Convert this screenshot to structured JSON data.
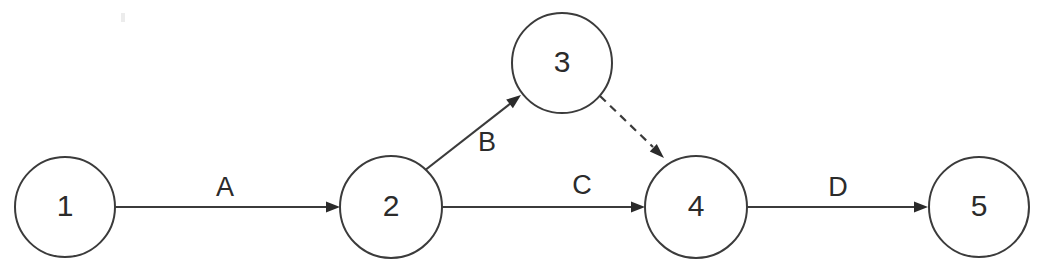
{
  "diagram": {
    "background_color": "#ffffff",
    "stroke_color": "#3b3b3b",
    "text_color": "#2b2b2b",
    "nodes": [
      {
        "id": "1",
        "label": "1",
        "cx": 65,
        "cy": 207,
        "r": 50
      },
      {
        "id": "2",
        "label": "2",
        "cx": 391,
        "cy": 207,
        "r": 51
      },
      {
        "id": "3",
        "label": "3",
        "cx": 562,
        "cy": 63,
        "r": 50
      },
      {
        "id": "4",
        "label": "4",
        "cx": 696,
        "cy": 207,
        "r": 51
      },
      {
        "id": "5",
        "label": "5",
        "cx": 979,
        "cy": 207,
        "r": 50
      }
    ],
    "edges": [
      {
        "id": "edge-a",
        "label": "A",
        "from": "1",
        "to": "2",
        "style": "solid",
        "arrow": true,
        "x1": 115,
        "y1": 207,
        "x2": 340,
        "y2": 207,
        "label_x": 225,
        "label_y": 189
      },
      {
        "id": "edge-b",
        "label": "B",
        "from": "2",
        "to": "3",
        "style": "solid",
        "arrow": true,
        "x1": 424,
        "y1": 171,
        "x2": 521,
        "y2": 95,
        "label_x": 487,
        "label_y": 144
      },
      {
        "id": "edge-c",
        "label": "C",
        "from": "2",
        "to": "4",
        "style": "solid",
        "arrow": true,
        "x1": 442,
        "y1": 207,
        "x2": 645,
        "y2": 207,
        "label_x": 582,
        "label_y": 187
      },
      {
        "id": "edge-dashed",
        "label": "",
        "from": "3",
        "to": "4",
        "style": "dashed",
        "arrow": true,
        "x1": 600,
        "y1": 96,
        "x2": 664,
        "y2": 158,
        "label_x": 0,
        "label_y": 0
      },
      {
        "id": "edge-d",
        "label": "D",
        "from": "4",
        "to": "5",
        "style": "solid",
        "arrow": true,
        "x1": 747,
        "y1": 207,
        "x2": 928,
        "y2": 207,
        "label_x": 838,
        "label_y": 189
      }
    ]
  }
}
